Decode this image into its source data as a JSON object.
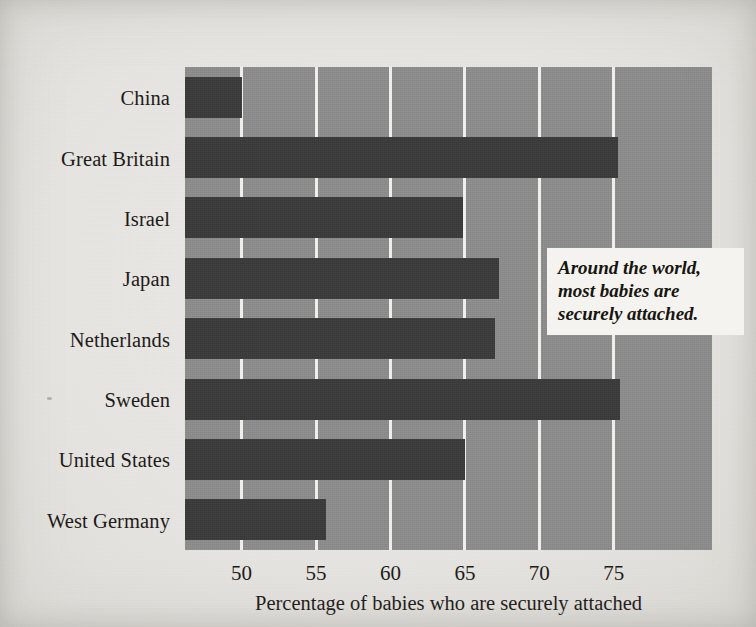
{
  "chart_data": {
    "type": "bar",
    "orientation": "horizontal",
    "title": "",
    "subtitle": "",
    "xlabel": "Percentage of babies who are securely attached",
    "ylabel": "",
    "categories": [
      "China",
      "Great Britain",
      "Israel",
      "Japan",
      "Netherlands",
      "Sweden",
      "United States",
      "West Germany"
    ],
    "values": [
      50.0,
      75.3,
      64.9,
      67.3,
      67.0,
      75.4,
      65.0,
      55.7
    ],
    "series": [
      {
        "name": "Percentage securely attached",
        "values": [
          50.0,
          75.3,
          64.9,
          67.3,
          67.0,
          75.4,
          65.0,
          55.7
        ]
      }
    ],
    "xlim": [
      46.2,
      81.6
    ],
    "xticks": [
      50,
      55,
      60,
      65,
      70,
      75
    ],
    "xtick_labels": [
      "50",
      "55",
      "60",
      "65",
      "70",
      "75"
    ],
    "grid": true,
    "grid_axis": "x",
    "legend": false,
    "legend_position": "none",
    "bars_start_at_axis_minimum": true,
    "annotations": [
      {
        "name": "callout",
        "text": "Around the world, most babies are securely attached.",
        "lines": [
          "Around the world,",
          "most babies are",
          "securely attached."
        ],
        "style": "bold-italic",
        "position": "upper-right-inside-plot"
      }
    ],
    "colors": {
      "bar": "#3a3a3a",
      "plot_background": "#8d8d8d",
      "gridline": "#efeeea",
      "page_background": "#e8e7e3",
      "text": "#1d1b19",
      "callout_background": "#f4f3ef",
      "callout_text": "#17150f"
    }
  },
  "axis": {
    "x_title": "Percentage of babies who are securely attached",
    "ticks": [
      {
        "value": 50,
        "label": "50"
      },
      {
        "value": 55,
        "label": "55"
      },
      {
        "value": 60,
        "label": "60"
      },
      {
        "value": 65,
        "label": "65"
      },
      {
        "value": 70,
        "label": "70"
      },
      {
        "value": 75,
        "label": "75"
      }
    ]
  },
  "bars": [
    {
      "label": "China",
      "value": 50.0
    },
    {
      "label": "Great Britain",
      "value": 75.3
    },
    {
      "label": "Israel",
      "value": 64.9
    },
    {
      "label": "Japan",
      "value": 67.3
    },
    {
      "label": "Netherlands",
      "value": 67.0
    },
    {
      "label": "Sweden",
      "value": 75.4
    },
    {
      "label": "United States",
      "value": 65.0
    },
    {
      "label": "West Germany",
      "value": 55.7
    }
  ],
  "callout": {
    "line1": "Around the world,",
    "line2": "most babies are",
    "line3": "securely attached."
  }
}
